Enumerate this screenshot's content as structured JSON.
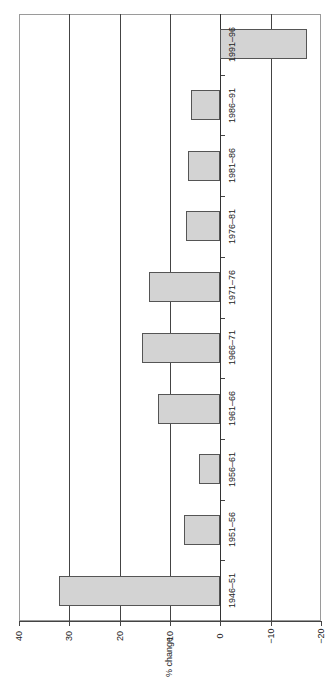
{
  "chart_data": {
    "type": "bar",
    "orientation": "vertical bars, image rotated 90 degrees counterclockwise",
    "title": "",
    "xlabel": "",
    "ylabel": "% change",
    "ylim": [
      -20,
      40
    ],
    "yticks": [
      40,
      30,
      20,
      10,
      0,
      -10,
      -20
    ],
    "ytick_labels": [
      "40",
      "30",
      "20",
      "10",
      "0",
      "−10",
      "−20"
    ],
    "grid": true,
    "legend": null,
    "categories": [
      "1946–51",
      "1951–56",
      "1956–61",
      "1961–66",
      "1966–71",
      "1971–76",
      "1976–81",
      "1981–86",
      "1986–91",
      "1991–96"
    ],
    "values": [
      32,
      7.2,
      4.3,
      12.3,
      15.6,
      14.1,
      6.8,
      6.5,
      5.8,
      -17.3
    ],
    "bar_color": "#d3d3d3"
  }
}
